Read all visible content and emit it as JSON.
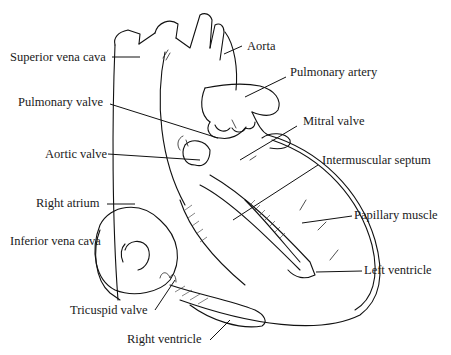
{
  "diagram": {
    "labels": [
      {
        "id": "superior-vena-cava",
        "text": "Superior vena cava"
      },
      {
        "id": "aorta",
        "text": "Aorta"
      },
      {
        "id": "pulmonary-artery",
        "text": "Pulmonary artery"
      },
      {
        "id": "pulmonary-valve",
        "text": "Pulmonary valve"
      },
      {
        "id": "mitral-valve",
        "text": "Mitral valve"
      },
      {
        "id": "aortic-valve",
        "text": "Aortic valve"
      },
      {
        "id": "intermuscular-septum",
        "text": "Intermuscular septum"
      },
      {
        "id": "right-atrium",
        "text": "Right atrium"
      },
      {
        "id": "papillary-muscle",
        "text": "Papillary muscle"
      },
      {
        "id": "inferior-vena-cava",
        "text": "Inferior vena cava"
      },
      {
        "id": "left-ventricle",
        "text": "Left ventricle"
      },
      {
        "id": "tricuspid-valve",
        "text": "Tricuspid valve"
      },
      {
        "id": "right-ventricle",
        "text": "Right ventricle"
      }
    ]
  },
  "colors": {
    "ink": "#111111",
    "background": "#ffffff"
  }
}
